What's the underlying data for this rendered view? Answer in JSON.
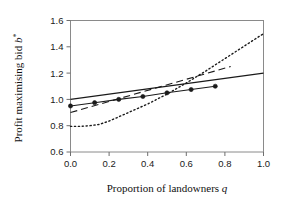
{
  "chart_data": {
    "type": "line",
    "title": "",
    "xlabel": "Proportion of landowners q",
    "xlabel_plain": "Proportion of landowners",
    "xlabel_symbol": "q",
    "ylabel": "Profit maximising bid b*",
    "ylabel_plain": "Profit maximising  bid",
    "ylabel_symbol": "b",
    "ylabel_superscript": "*",
    "xlim": [
      0.0,
      1.0
    ],
    "ylim": [
      0.6,
      1.6
    ],
    "xticks": [
      0.0,
      0.2,
      0.4,
      0.6,
      0.8,
      1.0
    ],
    "xtick_labels": [
      "0.0",
      "0.2",
      "0.4",
      "0.6",
      "0.8",
      "1.0"
    ],
    "yticks": [
      0.6,
      0.8,
      1.0,
      1.2,
      1.4,
      1.6
    ],
    "ytick_labels": [
      "0.6",
      "0.8",
      "1.0",
      "1.2",
      "1.4",
      "1.6"
    ],
    "grid": false,
    "legend": "none",
    "frame": "box",
    "series": [
      {
        "name": "solid-line",
        "style": "solid",
        "color": "#1a1a1a",
        "width": 1.1,
        "marker": "none",
        "x": [
          0.0,
          1.0
        ],
        "y": [
          1.0,
          1.2
        ]
      },
      {
        "name": "dashed-line",
        "style": "dashed",
        "color": "#1a1a1a",
        "width": 1.1,
        "marker": "none",
        "x": [
          0.0,
          0.83
        ],
        "y": [
          0.9,
          1.25
        ]
      },
      {
        "name": "dotted-curve",
        "style": "dotted",
        "color": "#1a1a1a",
        "width": 1.4,
        "marker": "none",
        "x": [
          0.0,
          0.05,
          0.1,
          0.15,
          0.2,
          0.3,
          0.4,
          0.5,
          0.6,
          0.7,
          0.8,
          0.9,
          1.0
        ],
        "y": [
          0.795,
          0.795,
          0.8,
          0.81,
          0.835,
          0.9,
          0.965,
          1.04,
          1.125,
          1.215,
          1.31,
          1.405,
          1.5
        ]
      },
      {
        "name": "marker-series",
        "style": "solid",
        "color": "#1a1a1a",
        "width": 1.1,
        "marker": "filled-circle",
        "marker_size": 4.2,
        "x": [
          0.0,
          0.125,
          0.25,
          0.375,
          0.5,
          0.625,
          0.75
        ],
        "y": [
          0.95,
          0.975,
          1.0,
          1.022,
          1.05,
          1.075,
          1.1
        ]
      }
    ]
  },
  "figure": {
    "background": "#ffffff",
    "axis_color": "#808080",
    "text_color": "#1a1a1a"
  }
}
